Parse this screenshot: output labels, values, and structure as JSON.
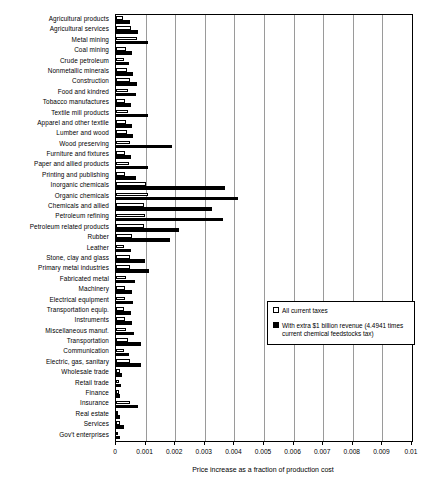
{
  "chart_data": {
    "type": "bar",
    "orientation": "horizontal",
    "title": "",
    "xlabel": "Price increase as a fraction of production cost",
    "ylabel": "",
    "xlim": [
      0,
      0.01
    ],
    "xticks": [
      "0",
      "0.001",
      "0.002",
      "0.003",
      "0.004",
      "0.005",
      "0.006",
      "0.007",
      "0.008",
      "0.009",
      "0.01"
    ],
    "xtick_values": [
      0,
      0.001,
      0.002,
      0.003,
      0.004,
      0.005,
      0.006,
      0.007,
      0.008,
      0.009,
      0.01
    ],
    "grid": true,
    "grid_axis": "x",
    "legend_position": "middle-right",
    "categories": [
      "Agricultural products",
      "Agricultural services",
      "Metal mining",
      "Coal mining",
      "Crude petroleum",
      "Nonmetallic minerals",
      "Construction",
      "Food and kindred",
      "Tobacco manufactures",
      "Textile mill products",
      "Apparel and other textile",
      "Lumber and wood",
      "Wood preserving",
      "Furniture and fixtures",
      "Paper and allied products",
      "Printing and publishing",
      "Inorganic chemicals",
      "Organic chemicals",
      "Chemicals and allied",
      "Petroleum refining",
      "Petroleum related products",
      "Rubber",
      "Leather",
      "Stone, clay and glass",
      "Primary metal industries",
      "Fabricated metal",
      "Machinery",
      "Electrical equipment",
      "Transportation equip.",
      "Instruments",
      "Miscellaneous manuf.",
      "Transportation",
      "Communication",
      "Electric, gas, sanitary",
      "Wholesale trade",
      "Retail trade",
      "Finance",
      "Insurance",
      "Real estate",
      "Services",
      "Gov't enterprises"
    ],
    "series": [
      {
        "name": "All current taxes",
        "key": "light",
        "color": "#ffffff",
        "edgecolor": "#000000",
        "values": [
          0.00022,
          0.00052,
          0.00071,
          0.00034,
          0.00026,
          0.00036,
          0.00046,
          0.0004,
          0.0003,
          0.00042,
          0.00034,
          0.00036,
          0.00046,
          0.0003,
          0.00044,
          0.0003,
          0.00103,
          0.00108,
          0.00094,
          0.00097,
          0.00093,
          0.00054,
          0.00028,
          0.00046,
          0.00046,
          0.00035,
          0.0003,
          0.00031,
          0.00028,
          0.0003,
          0.00033,
          0.00042,
          0.00026,
          0.00048,
          0.00013,
          0.00011,
          9e-05,
          0.00047,
          8e-05,
          0.00014,
          8e-05
        ]
      },
      {
        "name": "With extra $1 billion revenue (4.4941 times current chemical feedstocks tax)",
        "key": "dark",
        "color": "#000000",
        "values": [
          0.00048,
          0.00076,
          0.00107,
          0.00055,
          0.00043,
          0.00057,
          0.00072,
          0.00066,
          0.00049,
          0.00109,
          0.00054,
          0.00058,
          0.00189,
          0.00049,
          0.00107,
          0.00066,
          0.00368,
          0.00412,
          0.00323,
          0.00362,
          0.00212,
          0.00184,
          0.0005,
          0.00097,
          0.0011,
          0.00065,
          0.00054,
          0.00058,
          0.00051,
          0.00054,
          0.0006,
          0.00084,
          0.00044,
          0.00086,
          0.0002,
          0.00018,
          0.00015,
          0.00073,
          0.00013,
          0.00027,
          0.00014
        ]
      }
    ],
    "legend": [
      {
        "label": "All current taxes",
        "swatch": "light"
      },
      {
        "label": "With extra $1 billion revenue (4.4941 times current chemical feedstocks tax)",
        "swatch": "dark"
      }
    ],
    "colors": {
      "series_light_fill": "#ffffff",
      "series_dark_fill": "#000000",
      "axis": "#000000",
      "gridline": "#9a9a9a",
      "background": "#ffffff"
    }
  }
}
